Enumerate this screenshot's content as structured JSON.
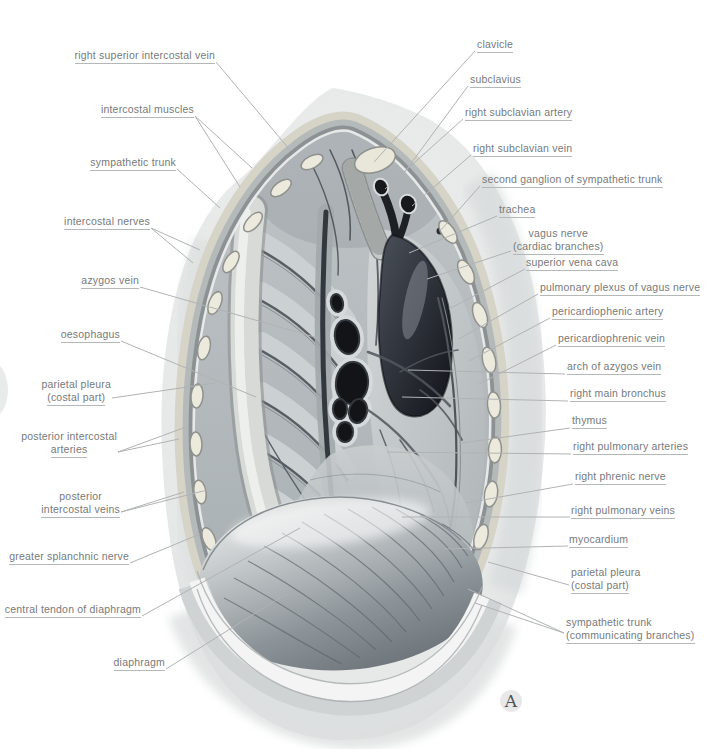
{
  "figure_labels": {
    "left": [
      {
        "line1": "right superior intercostal vein"
      },
      {
        "line1": "intercostal muscles"
      },
      {
        "line1": "sympathetic trunk"
      },
      {
        "line1": "intercostal nerves"
      },
      {
        "line1": "azygos vein"
      },
      {
        "line1": "oesophagus"
      },
      {
        "line1": "parietal pleura",
        "line2": "(costal part)"
      },
      {
        "line1": "posterior intercostal",
        "line2": "arteries"
      },
      {
        "line1": "posterior",
        "line2": "intercostal veins"
      },
      {
        "line1": "greater splanchnic nerve"
      },
      {
        "line1": "central tendon of diaphragm"
      },
      {
        "line1": "diaphragm"
      }
    ],
    "right": [
      {
        "line1": "clavicle"
      },
      {
        "line1": "subclavius"
      },
      {
        "line1": "right subclavian artery"
      },
      {
        "line1": "right subclavian vein"
      },
      {
        "line1": "second ganglion of sympathetic trunk"
      },
      {
        "line1": "trachea"
      },
      {
        "line1": "vagus nerve",
        "line2": "(cardiac branches)"
      },
      {
        "line1": "superior vena cava"
      },
      {
        "line1": "pulmonary plexus of vagus nerve"
      },
      {
        "line1": "pericardiophenic artery"
      },
      {
        "line1": "pericardiophrenic vein"
      },
      {
        "line1": "arch of azygos vein"
      },
      {
        "line1": "right main bronchus"
      },
      {
        "line1": "thymus"
      },
      {
        "line1": "right pulmonary arteries"
      },
      {
        "line1": "right phrenic nerve"
      },
      {
        "line1": "right pulmonary veins"
      },
      {
        "line1": "myocardium"
      },
      {
        "line1": "parietal pleura",
        "line2": "(costal part)"
      },
      {
        "line1": "sympathetic trunk",
        "line2": "(communicating branches)"
      }
    ]
  },
  "panel": {
    "letter": "A"
  },
  "colors": {
    "label_text": "#777a7b",
    "leader_line": "#b0b3b3"
  }
}
